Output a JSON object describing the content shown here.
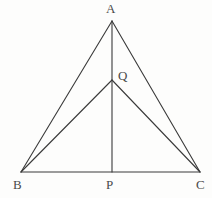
{
  "figure": {
    "background_color": "#fdfdfc",
    "stroke_color": "#3a3a3a",
    "label_color": "#4a4a4a",
    "stroke_width": 1.1,
    "points": {
      "A": {
        "name": "A",
        "x": 112,
        "y": 21
      },
      "B": {
        "name": "B",
        "x": 21,
        "y": 172
      },
      "C": {
        "name": "C",
        "x": 200,
        "y": 172
      },
      "P": {
        "name": "P",
        "x": 112,
        "y": 172
      },
      "Q": {
        "name": "Q",
        "x": 112,
        "y": 80
      }
    },
    "labels": {
      "A": "A",
      "B": "B",
      "C": "C",
      "P": "P",
      "Q": "Q"
    },
    "segments": [
      {
        "name": "AB",
        "from": "A",
        "to": "B"
      },
      {
        "name": "AC",
        "from": "A",
        "to": "C"
      },
      {
        "name": "BC",
        "from": "B",
        "to": "C"
      },
      {
        "name": "AP",
        "from": "A",
        "to": "P"
      },
      {
        "name": "BQ",
        "from": "B",
        "to": "Q"
      },
      {
        "name": "QC",
        "from": "Q",
        "to": "C"
      }
    ]
  }
}
